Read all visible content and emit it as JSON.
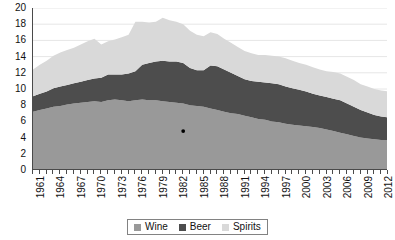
{
  "chart_data": {
    "type": "area",
    "stacked": true,
    "title": "",
    "subtitle": "",
    "xlabel": "",
    "ylabel": "",
    "xlim": [
      1961,
      2013
    ],
    "ylim": [
      0,
      20
    ],
    "ytick_step": 2,
    "ytick_labels": [
      "0",
      "2",
      "4",
      "6",
      "8",
      "10",
      "12",
      "14",
      "16",
      "18",
      "20"
    ],
    "xtick_label_step": 3,
    "xtick_labels": [
      "1961",
      "1964",
      "1967",
      "1970",
      "1973",
      "1976",
      "1979",
      "1982",
      "1985",
      "1988",
      "1991",
      "1994",
      "1997",
      "2000",
      "2003",
      "2006",
      "2009",
      "2012"
    ],
    "grid": "horizontal",
    "grid_color": "#e6e6e6",
    "axis_color": "#4a4a4a",
    "legend_position": "bottom-center",
    "x": [
      1961,
      1962,
      1963,
      1964,
      1965,
      1966,
      1967,
      1968,
      1969,
      1970,
      1971,
      1972,
      1973,
      1974,
      1975,
      1976,
      1977,
      1978,
      1979,
      1980,
      1981,
      1982,
      1983,
      1984,
      1985,
      1986,
      1987,
      1988,
      1989,
      1990,
      1991,
      1992,
      1993,
      1994,
      1995,
      1996,
      1997,
      1998,
      1999,
      2000,
      2001,
      2002,
      2003,
      2004,
      2005,
      2006,
      2007,
      2008,
      2009,
      2010,
      2011,
      2012,
      2013
    ],
    "series": [
      {
        "name": "Wine",
        "color": "#999999",
        "values": [
          7.2,
          7.4,
          7.6,
          7.8,
          7.9,
          8.1,
          8.2,
          8.3,
          8.4,
          8.5,
          8.4,
          8.6,
          8.7,
          8.6,
          8.5,
          8.6,
          8.7,
          8.6,
          8.6,
          8.5,
          8.4,
          8.3,
          8.2,
          8.0,
          7.9,
          7.8,
          7.6,
          7.4,
          7.2,
          7.0,
          6.9,
          6.7,
          6.5,
          6.3,
          6.2,
          6.0,
          5.9,
          5.7,
          5.6,
          5.5,
          5.4,
          5.3,
          5.2,
          5.0,
          4.8,
          4.6,
          4.4,
          4.2,
          4.0,
          3.9,
          3.8,
          3.7,
          3.7
        ]
      },
      {
        "name": "Beer",
        "color": "#4d4d4d",
        "values": [
          1.9,
          2.0,
          2.1,
          2.3,
          2.4,
          2.4,
          2.5,
          2.6,
          2.7,
          2.8,
          3.0,
          3.2,
          3.1,
          3.2,
          3.4,
          3.6,
          4.3,
          4.6,
          4.8,
          5.0,
          5.0,
          5.1,
          5.0,
          4.6,
          4.4,
          4.5,
          5.3,
          5.4,
          5.2,
          5.0,
          4.7,
          4.5,
          4.5,
          4.6,
          4.6,
          4.7,
          4.7,
          4.6,
          4.5,
          4.4,
          4.3,
          4.1,
          4.0,
          4.0,
          4.0,
          4.0,
          3.8,
          3.6,
          3.4,
          3.2,
          3.0,
          2.9,
          2.8
        ]
      },
      {
        "name": "Spirits",
        "color": "#d9d9d9",
        "values": [
          3.3,
          3.6,
          3.8,
          4.0,
          4.2,
          4.3,
          4.4,
          4.6,
          4.8,
          4.9,
          4.1,
          4.1,
          4.3,
          4.6,
          4.8,
          6.1,
          5.3,
          5.0,
          4.9,
          5.3,
          5.1,
          4.9,
          4.8,
          4.6,
          4.4,
          4.2,
          4.1,
          4.0,
          3.8,
          3.7,
          3.6,
          3.5,
          3.4,
          3.3,
          3.4,
          3.4,
          3.4,
          3.5,
          3.4,
          3.3,
          3.3,
          3.3,
          3.2,
          3.2,
          3.3,
          3.3,
          3.3,
          3.3,
          3.2,
          3.2,
          3.2,
          3.2,
          3.2
        ]
      }
    ],
    "markers": [
      {
        "label": "",
        "x": 1983,
        "y": 4.8,
        "color": "#000000"
      }
    ]
  },
  "legend": {
    "items": [
      {
        "label": "Wine",
        "color": "#999999"
      },
      {
        "label": "Beer",
        "color": "#4d4d4d"
      },
      {
        "label": "Spirits",
        "color": "#d9d9d9"
      }
    ]
  }
}
